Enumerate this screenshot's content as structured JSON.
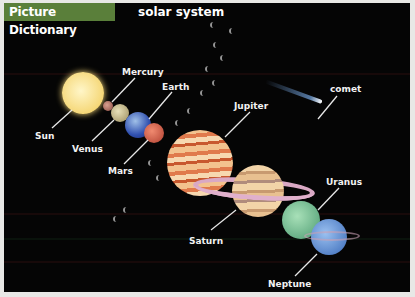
{
  "header": {
    "tab_label": "Picture Dictionary",
    "title": "solar system"
  },
  "colors": {
    "tab_bg": "#5a7f3a",
    "background": "#050505",
    "label_text": "#f2f2f2"
  },
  "labels": {
    "sun": "Sun",
    "mercury": "Mercury",
    "venus": "Venus",
    "earth": "Earth",
    "mars": "Mars",
    "jupiter": "Jupiter",
    "comet": "comet",
    "saturn": "Saturn",
    "uranus": "Uranus",
    "neptune": "Neptune"
  }
}
